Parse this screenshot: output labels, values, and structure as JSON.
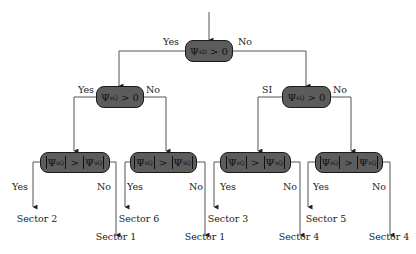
{
  "diagram": {
    "type": "decision-tree",
    "colors": {
      "node_fill": "#5c5c5c",
      "node_border": "#1a1a1a",
      "line": "#555555",
      "text": "#222222"
    },
    "root": {
      "symbol": "Ψ",
      "subscript": "sD",
      "op": "> 0",
      "yes_label": "Yes",
      "no_label": "No"
    },
    "level2": [
      {
        "symbol": "Ψ",
        "subscript": "sQ",
        "op": "> 0",
        "yes_label": "Yes",
        "no_label": "No"
      },
      {
        "symbol": "Ψ",
        "subscript": "sQ",
        "op": "> 0",
        "yes_label": "SI",
        "no_label": "No"
      }
    ],
    "level3": [
      {
        "lhs_symbol": "Ψ",
        "lhs_sub": "sQ",
        "op": ">",
        "rhs_symbol": "Ψ",
        "rhs_sup": "'",
        "rhs_sub": "sQ",
        "yes_label": "Yes",
        "no_label": "No",
        "yes_sector": "Sector 2",
        "no_sector": "Sector 1"
      },
      {
        "lhs_symbol": "Ψ",
        "lhs_sub": "sQ",
        "op": ">",
        "rhs_symbol": "Ψ",
        "rhs_sup": "'",
        "rhs_sub": "sQ",
        "yes_label": "Yes",
        "no_label": "No",
        "yes_sector": "Sector 6",
        "no_sector": "Sector 1"
      },
      {
        "lhs_symbol": "Ψ",
        "lhs_sub": "sQ",
        "op": ">",
        "rhs_symbol": "Ψ",
        "rhs_sup": "'",
        "rhs_sub": "sQ",
        "yes_label": "Yes",
        "no_label": "No",
        "yes_sector": "Sector 3",
        "no_sector": "Sector 4"
      },
      {
        "lhs_symbol": "Ψ",
        "lhs_sub": "sQ",
        "op": ">",
        "rhs_symbol": "Ψ",
        "rhs_sup": "'",
        "rhs_sub": "sQ",
        "yes_label": "Yes",
        "no_label": "No",
        "yes_sector": "Sector 5",
        "no_sector": "Sector 4"
      }
    ]
  }
}
